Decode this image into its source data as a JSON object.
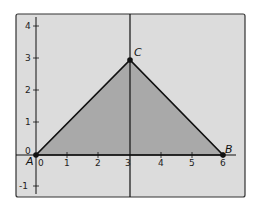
{
  "diagram": {
    "type": "coordinate-plane",
    "colors": {
      "background": "#ffffff",
      "plane_fill": "#dcdcdc",
      "triangle_fill": "#a9a9a9",
      "lines": "#1a1a1a",
      "frame": "#333333"
    },
    "x_axis": {
      "min": -0.6,
      "max": 6.7,
      "ticks": [
        "0",
        "1",
        "2",
        "3",
        "4",
        "5",
        "6"
      ]
    },
    "y_axis": {
      "min": -1.3,
      "max": 4.4,
      "ticks": [
        "-1",
        "0",
        "1",
        "2",
        "3",
        "4"
      ]
    },
    "points": [
      {
        "label": "A",
        "x": 0,
        "y": 0
      },
      {
        "label": "B",
        "x": 6,
        "y": 0
      },
      {
        "label": "C",
        "x": 3,
        "y": 3
      }
    ],
    "polygon": {
      "name": "triangle ABC",
      "vertices": [
        "A",
        "B",
        "C"
      ]
    },
    "vertical_line": {
      "x": 3
    }
  }
}
